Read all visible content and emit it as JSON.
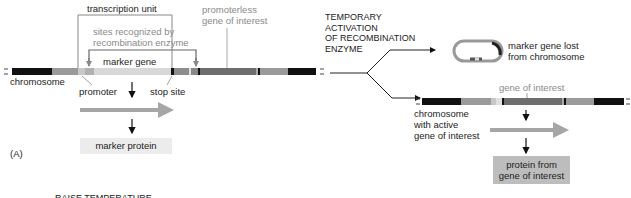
{
  "figure": {
    "panel_label": "(A)",
    "bottom_cutoff_text": "RAISE TEMPERATURE"
  },
  "left": {
    "transcription_unit": "transcription unit",
    "sites_line1": "sites recognized by",
    "sites_line2": "recombination enzyme",
    "promoterless_line1": "promoterless",
    "promoterless_line2": "gene of interest",
    "marker_gene": "marker gene",
    "chromosome": "chromosome",
    "promoter": "promoter",
    "stop_site": "stop site",
    "marker_protein": "marker protein"
  },
  "middle": {
    "step_line1": "TEMPORARY",
    "step_line2": "ACTIVATION",
    "step_line3": "OF RECOMBINATION",
    "step_line4": "ENZYME"
  },
  "right": {
    "lost_line1": "marker gene lost",
    "lost_line2": "from chromosome",
    "gene_of_interest": "gene of interest",
    "chrom_line1": "chromosome",
    "chrom_line2": "with active",
    "chrom_line3": "gene of interest",
    "protein_line1": "protein from",
    "protein_line2": "gene of interest"
  },
  "colors": {
    "black_segment": "#111111",
    "gray_segment": "#9a9a9a",
    "light_segment": "#d4d4d4",
    "dark_gene": "#6e6e6e",
    "arrow_gray": "#a6a6a6",
    "marker_box": "#ececec",
    "protein_box": "#bdbdbd"
  }
}
